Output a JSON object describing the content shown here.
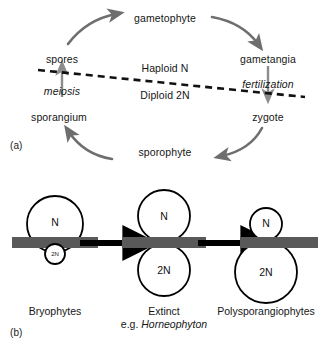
{
  "figure": {
    "panel_a": {
      "tag": "(a)",
      "cycle_nodes": [
        {
          "id": "gametophyte",
          "label": "gametophyte",
          "x": 165,
          "y": 18
        },
        {
          "id": "gametangia",
          "label": "gametangia",
          "x": 268,
          "y": 59
        },
        {
          "id": "zygote",
          "label": "zygote",
          "x": 268,
          "y": 117
        },
        {
          "id": "sporophyte",
          "label": "sporophyte",
          "x": 165,
          "y": 152
        },
        {
          "id": "sporangium",
          "label": "sporangium",
          "x": 59,
          "y": 117
        },
        {
          "id": "spores",
          "label": "spores",
          "x": 62,
          "y": 59
        }
      ],
      "process_labels": [
        {
          "id": "meiosis",
          "label": "meiosis",
          "x": 62,
          "y": 90,
          "italic": true
        },
        {
          "id": "fertilization",
          "label": "fertilization",
          "x": 268,
          "y": 84,
          "italic": true
        }
      ],
      "ploidy_labels": [
        {
          "id": "haploid",
          "label": "Haploid N",
          "x": 165,
          "y": 68
        },
        {
          "id": "diploid",
          "label": "Diploid 2N",
          "x": 165,
          "y": 95
        }
      ],
      "divider": {
        "id": "ploidy-divider",
        "x1": 38,
        "y1": 70,
        "x2": 305,
        "y2": 97
      }
    },
    "panel_b": {
      "tag": "(b)",
      "stages": [
        {
          "id": "bryophytes",
          "caption_lines": [
            "Bryophytes"
          ],
          "caption_x": 55,
          "caption_y": 125,
          "gametophyte_label": "N",
          "sporophyte_label": "2N",
          "gametophyte_size": "large",
          "sporophyte_size": "small"
        },
        {
          "id": "extinct",
          "caption_lines": [
            "Extinct",
            "e.g. Horneophyton"
          ],
          "caption_italic_line": 1,
          "caption_x": 164,
          "caption_y": 125,
          "gametophyte_label": "N",
          "sporophyte_label": "2N",
          "gametophyte_size": "medium",
          "sporophyte_size": "medium"
        },
        {
          "id": "polysporangiophytes",
          "caption_lines": [
            "Polysporangiophytes"
          ],
          "caption_x": 266,
          "caption_y": 125,
          "gametophyte_label": "N",
          "sporophyte_label": "2N",
          "gametophyte_size": "small",
          "sporophyte_size": "large"
        }
      ],
      "transition_arrows": [
        {
          "id": "arrow-bryophytes-to-extinct",
          "x1": 80,
          "y1": 63,
          "x2": 128,
          "y2": 63
        },
        {
          "id": "arrow-extinct-to-polysporangiophytes",
          "x1": 198,
          "y1": 63,
          "x2": 246,
          "y2": 63
        }
      ],
      "substrate_label": "soil-surface-bar"
    }
  },
  "colors": {
    "cycle_arrow": "#6e6e6e",
    "process_arrow": "#8c8c8c",
    "divider": "#111111",
    "outline": "#000000",
    "substrate_bar": "#595959",
    "transition_arrow": "#000000",
    "text": "#161616",
    "background": "#ffffff"
  }
}
